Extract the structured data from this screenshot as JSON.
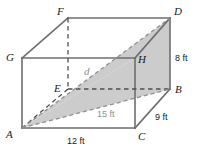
{
  "figure": {
    "type": "geometry-diagram",
    "shape": "rectangular-prism",
    "colors": {
      "edge": "#6e6e6e",
      "hidden_edge": "#5a5a5a",
      "shade_fill": "#c9c9c9",
      "shade_stroke": "#9a9a9a",
      "label_text": "#1a1a1a",
      "dim_gray_text": "#8f8f8f",
      "background": "#ffffff"
    },
    "vertices": [
      {
        "id": "F",
        "label": "F",
        "x": 68,
        "y": 18,
        "label_x": 57,
        "label_y": 6,
        "hidden": false
      },
      {
        "id": "D",
        "label": "D",
        "x": 170,
        "y": 18,
        "label_x": 174,
        "label_y": 6,
        "hidden": false
      },
      {
        "id": "G",
        "label": "G",
        "x": 22,
        "y": 58,
        "label_x": 6,
        "label_y": 52,
        "hidden": false
      },
      {
        "id": "H",
        "label": "H",
        "x": 135,
        "y": 58,
        "label_x": 138,
        "label_y": 54,
        "hidden": false
      },
      {
        "id": "E",
        "label": "E",
        "x": 68,
        "y": 89,
        "label_x": 54,
        "label_y": 83,
        "hidden": true
      },
      {
        "id": "B",
        "label": "B",
        "x": 170,
        "y": 89,
        "label_x": 175,
        "label_y": 84,
        "hidden": false
      },
      {
        "id": "A",
        "label": "A",
        "x": 22,
        "y": 128,
        "label_x": 6,
        "label_y": 129,
        "hidden": false
      },
      {
        "id": "C",
        "label": "C",
        "x": 135,
        "y": 128,
        "label_x": 138,
        "label_y": 131,
        "hidden": false
      }
    ],
    "dimensions": [
      {
        "id": "height",
        "value": "8 ft",
        "edge": "D-B",
        "x": 175,
        "y": 54,
        "style": "black"
      },
      {
        "id": "depth",
        "value": "9 ft",
        "edge": "B-C",
        "x": 155,
        "y": 113,
        "style": "black"
      },
      {
        "id": "width",
        "value": "12 ft",
        "edge": "A-C",
        "x": 67,
        "y": 137,
        "style": "black"
      },
      {
        "id": "face-diag",
        "value": "15 ft",
        "edge": "A-B",
        "x": 97,
        "y": 110,
        "style": "gray"
      }
    ],
    "diagonal": {
      "id": "space-diagonal",
      "label": "d",
      "from": "A",
      "to": "D",
      "x": 84,
      "y": 66
    },
    "shaded_region": {
      "id": "cross-section-ABD",
      "vertices": [
        "A",
        "B",
        "D",
        "H"
      ],
      "fill": "#c9c9c9"
    }
  }
}
